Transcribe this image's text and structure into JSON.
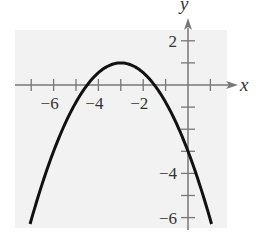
{
  "chart_data": {
    "type": "line",
    "title": "",
    "xlabel": "x",
    "ylabel": "y",
    "xlim": [
      -7.5,
      1.5
    ],
    "ylim": [
      -6.5,
      2.5
    ],
    "grid": false,
    "background": "#f2f2f2",
    "x_ticks": [
      -7,
      -6,
      -5,
      -4,
      -3,
      -2,
      -1,
      1
    ],
    "x_tick_labels": [
      {
        "value": -6,
        "label": "−6"
      },
      {
        "value": -4,
        "label": "−4"
      },
      {
        "value": -2,
        "label": "−2"
      }
    ],
    "y_ticks": [
      2,
      1,
      -1,
      -2,
      -3,
      -4,
      -5,
      -6
    ],
    "y_tick_labels": [
      {
        "value": 2,
        "label": "2"
      },
      {
        "value": -4,
        "label": "−4"
      },
      {
        "value": -6,
        "label": "−6"
      }
    ],
    "series": [
      {
        "name": "parabola",
        "description": "downward-opening parabola, vertex (-3, 1), y-intercept -3",
        "equation": "y = -(4/9)(x+3)^2 + 1",
        "vertex": [
          -3,
          1
        ],
        "x_intercepts": [
          -4.5,
          -1.5
        ],
        "y_intercept": -3,
        "x": [
          -7.05,
          -6,
          -5,
          -4.5,
          -4,
          -3,
          -2,
          -1.5,
          -1,
          0,
          1.05
        ],
        "y": [
          -6.3,
          -3,
          -0.78,
          0,
          0.56,
          1,
          0.56,
          0,
          -0.78,
          -3,
          -6.3
        ]
      }
    ],
    "colors": {
      "curve": "#111111",
      "axes": "#666666",
      "background": "#f2f2f2"
    }
  }
}
